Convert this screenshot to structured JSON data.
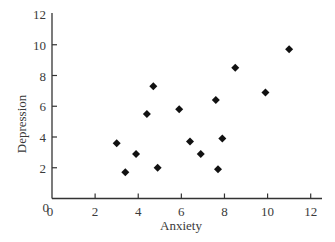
{
  "chart_data": {
    "type": "scatter",
    "title": "",
    "xlabel": "Anxiety",
    "ylabel": "Depression",
    "xlim": [
      0,
      12
    ],
    "ylim": [
      0,
      12
    ],
    "xticks": [
      0,
      2,
      4,
      6,
      8,
      10,
      12
    ],
    "yticks": [
      0,
      2,
      4,
      6,
      8,
      10,
      12
    ],
    "grid": false,
    "legend": null,
    "marker": "diamond",
    "marker_color": "#111111",
    "series": [
      {
        "name": "Anxiety vs Depression",
        "points": [
          {
            "x": 3.0,
            "y": 3.6
          },
          {
            "x": 3.4,
            "y": 1.7
          },
          {
            "x": 3.9,
            "y": 2.9
          },
          {
            "x": 4.4,
            "y": 5.5
          },
          {
            "x": 4.7,
            "y": 7.3
          },
          {
            "x": 4.9,
            "y": 2.0
          },
          {
            "x": 5.9,
            "y": 5.8
          },
          {
            "x": 6.4,
            "y": 3.7
          },
          {
            "x": 6.9,
            "y": 2.9
          },
          {
            "x": 7.6,
            "y": 6.4
          },
          {
            "x": 7.7,
            "y": 1.9
          },
          {
            "x": 7.9,
            "y": 3.9
          },
          {
            "x": 8.5,
            "y": 8.5
          },
          {
            "x": 9.9,
            "y": 6.9
          },
          {
            "x": 11.0,
            "y": 9.7
          }
        ]
      }
    ]
  },
  "axes": {
    "x_title": "Anxiety",
    "y_title": "Depression",
    "origin_x_label": "0",
    "origin_y_label": "0"
  }
}
